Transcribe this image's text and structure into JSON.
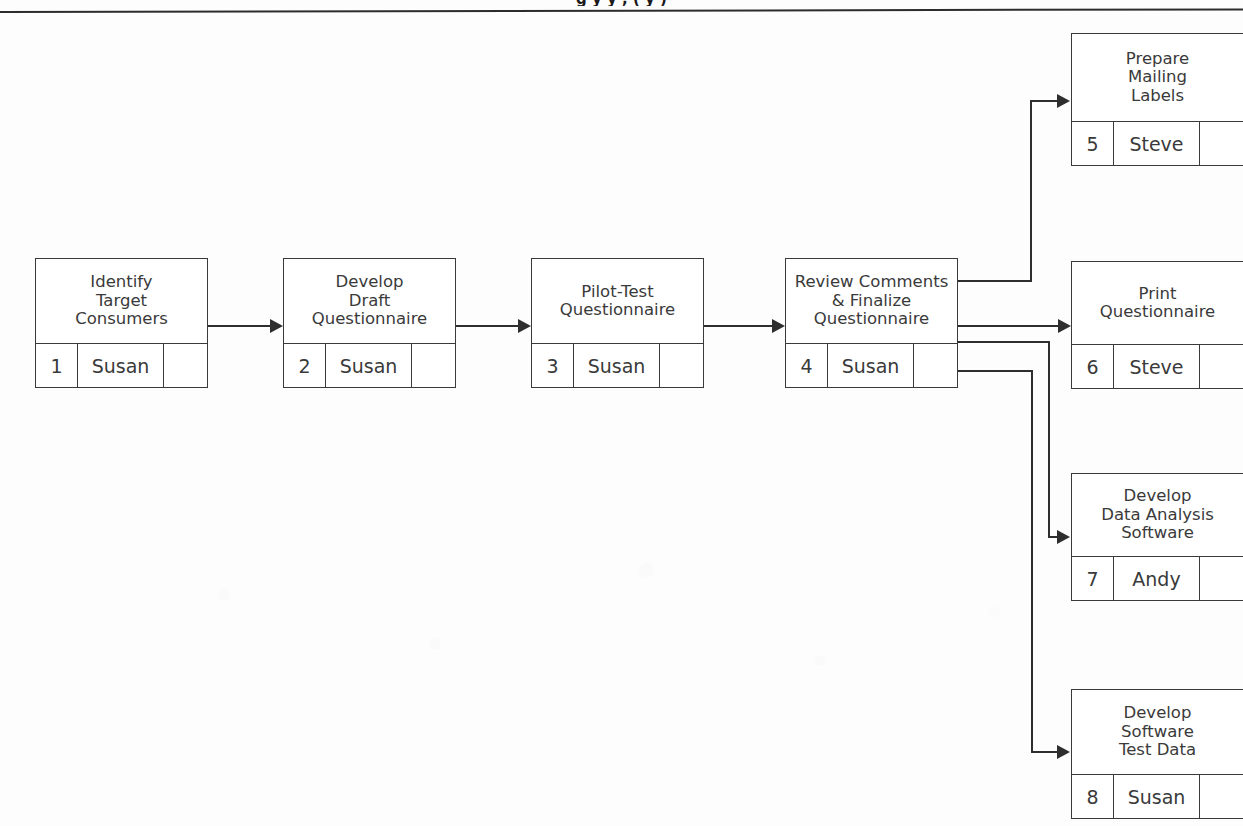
{
  "page": {
    "title_partial": "g                                                  y   y    , (       y                                  )",
    "background_color": "#fdfdfd",
    "line_color": "#2e2e2e",
    "box_border_color": "#3a3a3a",
    "text_color": "#3a3a3a"
  },
  "tasks": [
    {
      "key": "identify-target-consumers",
      "title": "Identify\nTarget\nConsumers",
      "id": "1",
      "owner": "Susan",
      "extra": ""
    },
    {
      "key": "develop-draft-questionnaire",
      "title": "Develop\nDraft\nQuestionnaire",
      "id": "2",
      "owner": "Susan",
      "extra": ""
    },
    {
      "key": "pilot-test-questionnaire",
      "title": "Pilot-Test\nQuestionnaire",
      "id": "3",
      "owner": "Susan",
      "extra": ""
    },
    {
      "key": "review-comments-finalize-questionnaire",
      "title": "Review Comments\n& Finalize\nQuestionnaire",
      "id": "4",
      "owner": "Susan",
      "extra": ""
    },
    {
      "key": "prepare-mailing-labels",
      "title": "Prepare\nMailing\nLabels",
      "id": "5",
      "owner": "Steve",
      "extra": ""
    },
    {
      "key": "print-questionnaire",
      "title": "Print\nQuestionnaire",
      "id": "6",
      "owner": "Steve",
      "extra": ""
    },
    {
      "key": "develop-data-analysis-software",
      "title": "Develop\nData Analysis\nSoftware",
      "id": "7",
      "owner": "Andy",
      "extra": ""
    },
    {
      "key": "develop-software-test-data",
      "title": "Develop\nSoftware\nTest Data",
      "id": "8",
      "owner": "Susan",
      "extra": ""
    }
  ],
  "connections": [
    {
      "from": "1",
      "to": "2"
    },
    {
      "from": "2",
      "to": "3"
    },
    {
      "from": "3",
      "to": "4"
    },
    {
      "from": "4",
      "to": "5"
    },
    {
      "from": "4",
      "to": "6"
    },
    {
      "from": "4",
      "to": "7"
    },
    {
      "from": "4",
      "to": "8"
    }
  ]
}
